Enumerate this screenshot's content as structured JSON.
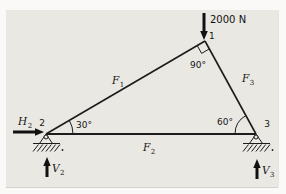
{
  "figure": {
    "type": "truss-free-body-diagram",
    "panel_bg": "#e9e8e3",
    "line_color": "#1c1c1c"
  },
  "force": {
    "label": "2000 N"
  },
  "nodes": {
    "n1": "1",
    "n2": "2",
    "n3": "3"
  },
  "angles": {
    "apex": "90°",
    "left": "30°",
    "right": "60°"
  },
  "members": {
    "f1": {
      "main": "F",
      "sub": "1"
    },
    "f2": {
      "main": "F",
      "sub": "2"
    },
    "f3": {
      "main": "F",
      "sub": "3"
    }
  },
  "reactions": {
    "h2": {
      "main": "H",
      "sub": "2"
    },
    "v2": {
      "main": "V",
      "sub": "2"
    },
    "v3": {
      "main": "V",
      "sub": "3"
    }
  }
}
